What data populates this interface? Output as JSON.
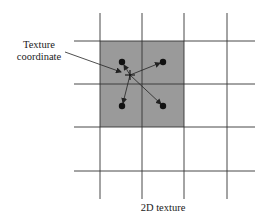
{
  "labels": {
    "coord_line1": "Texture",
    "coord_line2": "coordinate",
    "caption": "2D texture"
  },
  "grid": {
    "vertical_lines_x": [
      100,
      142,
      184,
      227
    ],
    "horizontal_lines_y": [
      41,
      84,
      127,
      171
    ],
    "line_color": "#333333",
    "highlight_fill": "#9a9a9a"
  },
  "texels": [
    {
      "x": 122,
      "y": 62
    },
    {
      "x": 163,
      "y": 62
    },
    {
      "x": 122,
      "y": 106
    },
    {
      "x": 163,
      "y": 106
    }
  ],
  "sample_point": {
    "x": 130,
    "y": 75
  }
}
